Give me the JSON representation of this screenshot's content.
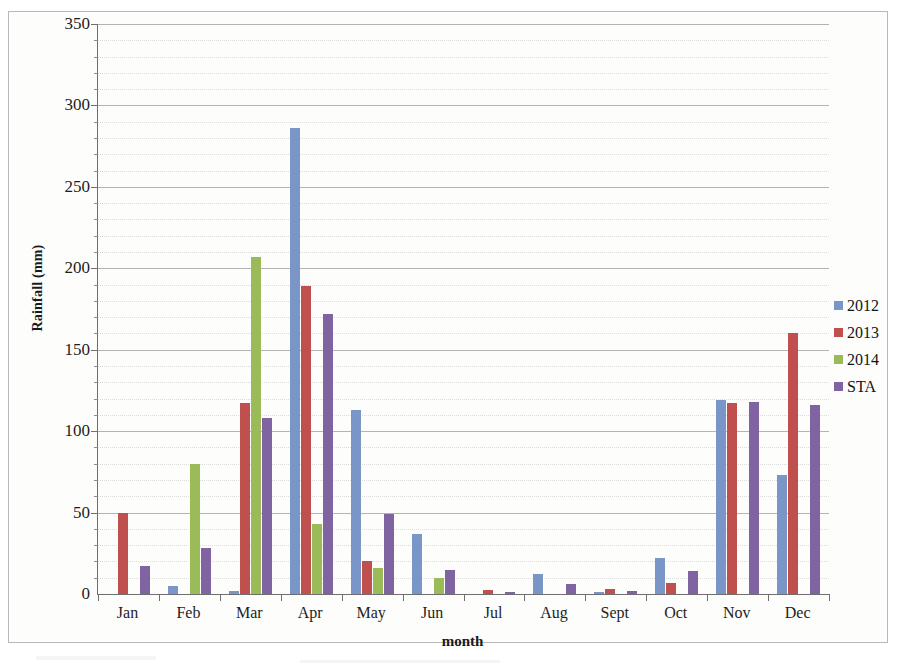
{
  "chart_data": {
    "type": "bar",
    "title": "",
    "xlabel": "month",
    "ylabel": "Rainfall (mm)",
    "ylim": [
      0,
      350
    ],
    "y_ticks": [
      0,
      50,
      100,
      150,
      200,
      250,
      300,
      350
    ],
    "y_minor_step": 10,
    "grid": true,
    "legend_position": "right",
    "categories": [
      "Jan",
      "Feb",
      "Mar",
      "Apr",
      "May",
      "Jun",
      "Jul",
      "Aug",
      "Sept",
      "Oct",
      "Nov",
      "Dec"
    ],
    "series": [
      {
        "name": "2012",
        "color": "#7a96c8",
        "values": [
          0,
          5,
          2,
          286,
          113,
          37,
          0,
          12,
          1,
          22,
          119,
          73
        ]
      },
      {
        "name": "2013",
        "color": "#c0504d",
        "values": [
          50,
          0,
          117,
          189,
          20,
          0,
          2.5,
          0,
          3,
          6.5,
          117,
          160
        ]
      },
      {
        "name": "2014",
        "color": "#9bbb59",
        "values": [
          0,
          80,
          207,
          43,
          16,
          10,
          0,
          0,
          0,
          0,
          0,
          0
        ]
      },
      {
        "name": "STA",
        "color": "#8064a2",
        "values": [
          17,
          28,
          108,
          172,
          49,
          15,
          1,
          6,
          2,
          14,
          118,
          116
        ]
      }
    ]
  },
  "legend": {
    "items": [
      {
        "label": "2012",
        "color": "#7a96c8"
      },
      {
        "label": "2013",
        "color": "#c0504d"
      },
      {
        "label": "2014",
        "color": "#9bbb59"
      },
      {
        "label": "STA",
        "color": "#8064a2"
      }
    ]
  },
  "axes": {
    "y_title": "Rainfall (mm)",
    "x_title": "month"
  }
}
